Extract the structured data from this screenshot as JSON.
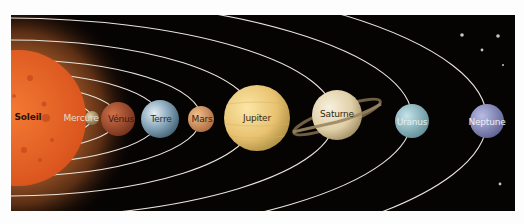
{
  "diagram": {
    "type": "solar-system",
    "background_color": "#060303",
    "orbit_color": "#e8e4dc",
    "bodies": [
      {
        "id": "soleil",
        "label": "Soleil",
        "cx": 18,
        "cy": 118,
        "r": 68,
        "color": "#ec6a2a",
        "label_color": "#2a1206"
      },
      {
        "id": "mercure",
        "label": "Mercure",
        "cx": 92,
        "cy": 118,
        "r": 7,
        "color": "#b8a070",
        "label_color": "#e8dccb"
      },
      {
        "id": "venus",
        "label": "Vénus",
        "cx": 118,
        "cy": 119,
        "r": 17,
        "color": "#b85a36",
        "label_color": "#3a1a10"
      },
      {
        "id": "terre",
        "label": "Terre",
        "cx": 160,
        "cy": 119,
        "r": 19,
        "color": "#8fb0c8",
        "label_color": "#20303c"
      },
      {
        "id": "mars",
        "label": "Mars",
        "cx": 201,
        "cy": 119,
        "r": 13,
        "color": "#dc9a68",
        "label_color": "#3a1e10"
      },
      {
        "id": "jupiter",
        "label": "Jupiter",
        "cx": 257,
        "cy": 118,
        "r": 33,
        "color": "#ecc978",
        "label_color": "#3a2a10"
      },
      {
        "id": "saturne",
        "label": "Saturne",
        "cx": 337,
        "cy": 115,
        "r": 25,
        "color": "#e6d8b6",
        "label_color": "#2e2616"
      },
      {
        "id": "uranus",
        "label": "Uranus",
        "cx": 412,
        "cy": 121,
        "r": 17,
        "color": "#8fb8c2",
        "label_color": "#e4f0f2"
      },
      {
        "id": "neptune",
        "label": "Neptune",
        "cx": 487,
        "cy": 121,
        "r": 17,
        "color": "#8a8fc0",
        "label_color": "#eceef8"
      }
    ],
    "stars": [
      {
        "cx": 462,
        "cy": 35,
        "r": 1.8
      },
      {
        "cx": 498,
        "cy": 36,
        "r": 1.8
      },
      {
        "cx": 482,
        "cy": 50,
        "r": 1.4
      },
      {
        "cx": 503,
        "cy": 65,
        "r": 1.0
      },
      {
        "cx": 500,
        "cy": 184,
        "r": 1.4
      }
    ]
  }
}
